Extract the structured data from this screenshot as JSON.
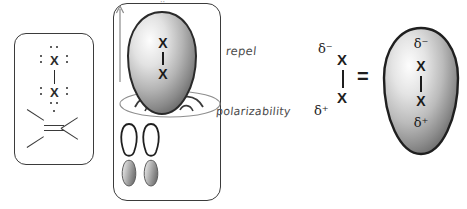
{
  "figure": {
    "title_mark": "··",
    "colors": {
      "outline": "#3b3b3b",
      "ink": "#1e1e1e",
      "hand_ink": "#4a4a4a",
      "orbital_light": "#fbfbfb",
      "orbital_mid": "#c9c9c9",
      "orbital_dark": "#6e6e6e",
      "orbital_edge": "#2a2a2a"
    }
  },
  "panel_left": {
    "name": "lewis-halogen-and-alkene",
    "top_atom": "X",
    "bottom_atom": "X",
    "bond": "single",
    "alkene_bond": "double",
    "top_atom_lone_pairs": [
      "top",
      "left",
      "right"
    ],
    "bottom_atom_lone_pairs": [
      "left",
      "right",
      "bottom"
    ]
  },
  "panel_mid": {
    "name": "orbital-interaction",
    "halogen_label_top": "X",
    "halogen_label_bottom": "X",
    "arrow": "up-arrow",
    "pi_plane": "alkene-pi-plane-ellipse",
    "p_orbitals": 2
  },
  "annotations": {
    "repel": "repel",
    "polarizability": "polarizability",
    "equals": "="
  },
  "polarized_pair": {
    "name": "polarized-halogen",
    "delta_negative": "δ⁻",
    "top_atom": "X",
    "bottom_atom": "X",
    "delta_positive": "δ⁺"
  },
  "panel_right": {
    "name": "polarized-halogen-orbital",
    "delta_negative": "δ⁻",
    "top_atom": "X",
    "bottom_atom": "X",
    "delta_positive": "δ⁺"
  }
}
